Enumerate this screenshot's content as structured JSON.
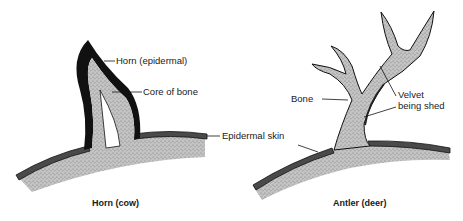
{
  "diagram": {
    "panels": [
      {
        "caption": "Horn (cow)",
        "labels": {
          "horn": "Horn (epidermal)",
          "core": "Core of bone",
          "skin": "Epidermal skin"
        }
      },
      {
        "caption": "Antler (deer)",
        "labels": {
          "bone": "Bone",
          "velvet_line1": "Velvet",
          "velvet_line2": "being shed"
        }
      }
    ],
    "colors": {
      "bone_fill": "#b8b8b8",
      "skin_dark": "#3a3a3a",
      "horn_black": "#111111",
      "line": "#1a1a1a"
    }
  }
}
